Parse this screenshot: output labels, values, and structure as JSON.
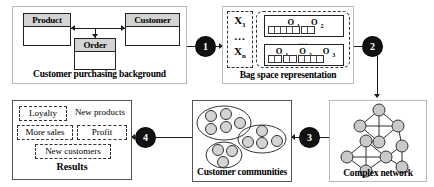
{
  "diagram": {
    "steps": [
      {
        "number": "1",
        "name": "step-1"
      },
      {
        "number": "2",
        "name": "step-2"
      },
      {
        "number": "3",
        "name": "step-3"
      },
      {
        "number": "4",
        "name": "step-4"
      }
    ]
  },
  "background_panel": {
    "caption": "Customer purchasing background",
    "classes": [
      {
        "name": "Product"
      },
      {
        "name": "Customer"
      },
      {
        "name": "Order"
      }
    ]
  },
  "bagspace_panel": {
    "caption": "Bag space representation",
    "instances": {
      "first": "X",
      "first_sub": "1",
      "dots": "...",
      "last": "X",
      "last_sub": "n"
    },
    "bags": [
      {
        "objects": [
          {
            "label": "O",
            "sub": "1"
          },
          {
            "label": "O",
            "sub": "2"
          }
        ],
        "item_groups": [
          5,
          2
        ]
      },
      {
        "objects": [
          {
            "label": "O",
            "sub": "1"
          },
          {
            "label": "O",
            "sub": "2"
          },
          {
            "label": "O",
            "sub": "3"
          }
        ],
        "item_groups": [
          2,
          2,
          4
        ]
      }
    ],
    "bags_dots": "..."
  },
  "network_panel": {
    "caption": "Complex network"
  },
  "communities_panel": {
    "caption": "Customer communities"
  },
  "results_panel": {
    "caption": "Results",
    "items": [
      {
        "label": "Loyalty",
        "boxed": true
      },
      {
        "label": "New products",
        "boxed": false
      },
      {
        "label": "More sales",
        "boxed": true
      },
      {
        "label": "Profit",
        "boxed": true
      },
      {
        "label": "New customers",
        "boxed": true
      }
    ]
  },
  "colors": {
    "badge_fill": "#111111",
    "class_header_fill": "#d4d4d4",
    "node_fill": "#c9c9c9",
    "stroke": "#222222",
    "panel_border": "#b9b9b9"
  }
}
